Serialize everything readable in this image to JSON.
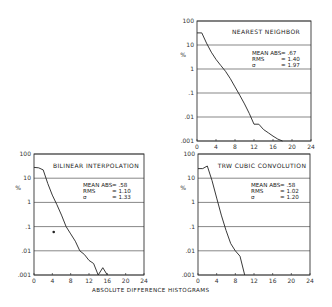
{
  "chart_data": [
    {
      "type": "line",
      "title": "NEAREST NEIGHBOR",
      "xlabel": "",
      "ylabel": "%",
      "yscale": "log",
      "xlim": [
        0,
        24
      ],
      "ylim": [
        0.001,
        100
      ],
      "xticks": [
        "0",
        "4",
        "8",
        "12",
        "16",
        "20",
        "24"
      ],
      "yticks": [
        "100",
        "10",
        "1",
        ".1",
        ".01",
        ".001"
      ],
      "grid": "horizontal",
      "stats": [
        {
          "label": "MEAN ABS",
          "value": "= .67"
        },
        {
          "label": "RMS",
          "value": "= 1.40"
        },
        {
          "label": "σ",
          "value": "= 1.97"
        }
      ],
      "x": [
        0,
        1,
        2,
        3,
        4,
        5,
        6,
        7,
        8,
        9,
        10,
        11,
        12,
        13,
        14,
        15,
        16,
        17,
        18
      ],
      "values": [
        32,
        32,
        12,
        5,
        2.5,
        1.4,
        0.8,
        0.4,
        0.18,
        0.08,
        0.035,
        0.014,
        0.005,
        0.005,
        0.003,
        0.0022,
        0.0016,
        0.0012,
        0.001
      ]
    },
    {
      "type": "line",
      "title": "BILINEAR INTERPOLATION",
      "xlabel": "",
      "ylabel": "%",
      "yscale": "log",
      "xlim": [
        0,
        24
      ],
      "ylim": [
        0.001,
        100
      ],
      "xticks": [
        "0",
        "4",
        "8",
        "12",
        "16",
        "20",
        "24"
      ],
      "yticks": [
        "100",
        "10",
        "1",
        ".1",
        ".01",
        ".001"
      ],
      "grid": "horizontal",
      "stats": [
        {
          "label": "MEAN ABS",
          "value": "= .58"
        },
        {
          "label": "RMS",
          "value": "= 1.10"
        },
        {
          "label": "σ",
          "value": "= 1.33"
        }
      ],
      "x": [
        0,
        1,
        2,
        3,
        4,
        5,
        6,
        7,
        8,
        9,
        10,
        11,
        12,
        13,
        14,
        15,
        16
      ],
      "values": [
        28,
        27,
        22,
        6,
        2,
        0.8,
        0.3,
        0.1,
        0.05,
        0.025,
        0.01,
        0.007,
        0.004,
        0.003,
        0.001,
        0.002,
        0.001
      ],
      "annotations": [
        {
          "type": "dot",
          "x": 4.3,
          "y": 0.06
        }
      ]
    },
    {
      "type": "line",
      "title": "TRW CUBIC CONVOLUTION",
      "xlabel": "",
      "ylabel": "%",
      "yscale": "log",
      "xlim": [
        0,
        24
      ],
      "ylim": [
        0.001,
        100
      ],
      "xticks": [
        "0",
        "4",
        "8",
        "12",
        "16",
        "20",
        "24"
      ],
      "yticks": [
        "100",
        "10",
        "1",
        ".1",
        ".01",
        ".001"
      ],
      "grid": "horizontal",
      "stats": [
        {
          "label": "MEAN ABS",
          "value": "= .58"
        },
        {
          "label": "RMS",
          "value": "= 1.02"
        },
        {
          "label": "σ",
          "value": "= 1.20"
        }
      ],
      "x": [
        0,
        1,
        2,
        3,
        4,
        5,
        6,
        7,
        8,
        9,
        10
      ],
      "values": [
        25,
        25,
        32,
        8,
        1.5,
        0.3,
        0.07,
        0.02,
        0.01,
        0.006,
        0.001
      ]
    }
  ],
  "caption": "ABSOLUTE DIFFERENCE HISTOGRAMS",
  "panels": [
    {
      "key": "nearest",
      "chart": 0,
      "box": [
        197,
        21,
        311,
        141
      ],
      "title_pos": [
        266,
        34
      ],
      "stats_pos": [
        252,
        55
      ],
      "ylabel_pos": [
        183,
        57
      ]
    },
    {
      "key": "bilinear",
      "chart": 1,
      "box": [
        34,
        154,
        144,
        275
      ],
      "title_pos": [
        96,
        168
      ],
      "stats_pos": [
        83,
        187
      ],
      "ylabel_pos": [
        18,
        190
      ]
    },
    {
      "key": "trw",
      "chart": 2,
      "box": [
        198,
        154,
        310,
        275
      ],
      "title_pos": [
        262,
        168
      ],
      "stats_pos": [
        251,
        187
      ],
      "ylabel_pos": [
        183,
        190
      ]
    }
  ],
  "caption_pos": [
    92,
    292
  ]
}
